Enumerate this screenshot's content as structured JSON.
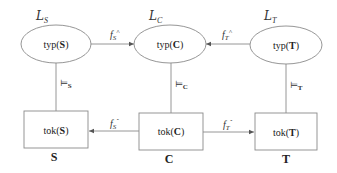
{
  "diagram": {
    "type": "commutative-channel-diagram",
    "languages": [
      {
        "id": "S",
        "symbol": "L",
        "subscript": "S"
      },
      {
        "id": "C",
        "symbol": "L",
        "subscript": "C"
      },
      {
        "id": "T",
        "symbol": "L",
        "subscript": "T"
      }
    ],
    "type_nodes": [
      {
        "id": "typS",
        "prefix": "typ(",
        "bold": "S",
        "suffix": ")"
      },
      {
        "id": "typC",
        "prefix": "typ(",
        "bold": "C",
        "suffix": ")"
      },
      {
        "id": "typT",
        "prefix": "typ(",
        "bold": "T",
        "suffix": ")"
      }
    ],
    "token_nodes": [
      {
        "id": "tokS",
        "prefix": "tok(",
        "bold": "S",
        "suffix": ")"
      },
      {
        "id": "tokC",
        "prefix": "tok(",
        "bold": "C",
        "suffix": ")"
      },
      {
        "id": "tokT",
        "prefix": "tok(",
        "bold": "T",
        "suffix": ")"
      }
    ],
    "classification_labels": [
      "S",
      "C",
      "T"
    ],
    "entailments": [
      {
        "symbol": "⊨",
        "subscript": "S"
      },
      {
        "symbol": "⊨",
        "subscript": "C"
      },
      {
        "symbol": "⊨",
        "subscript": "T"
      }
    ],
    "edges": [
      {
        "from": "typS",
        "to": "typC",
        "label": "f",
        "subscript": "S",
        "superscript": "^"
      },
      {
        "from": "typT",
        "to": "typC",
        "label": "f",
        "subscript": "T",
        "superscript": "^"
      },
      {
        "from": "tokC",
        "to": "tokS",
        "label": "f",
        "subscript": "S",
        "superscript": "ˇ"
      },
      {
        "from": "tokC",
        "to": "tokT",
        "label": "f",
        "subscript": "T",
        "superscript": "ˇ"
      }
    ],
    "colors": {
      "stroke": "#8a8a8a",
      "text": "#222222",
      "background": "#ffffff"
    }
  }
}
